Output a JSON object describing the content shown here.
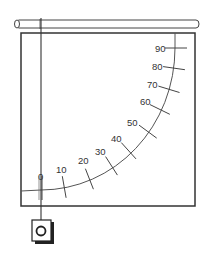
{
  "diagram": {
    "title": "",
    "type": "protractor-pendulum",
    "scale": {
      "unit": "degrees",
      "ticks": [
        {
          "value": "0",
          "x": 41,
          "y": 190,
          "lx": 38,
          "ly": 180,
          "ang": 90
        },
        {
          "value": "10",
          "x": 64,
          "y": 186,
          "lx": 56,
          "ly": 173,
          "ang": 84
        },
        {
          "value": "20",
          "x": 89,
          "y": 178,
          "lx": 78,
          "ly": 164,
          "ang": 72
        },
        {
          "value": "30",
          "x": 111,
          "y": 165,
          "lx": 95,
          "ly": 155,
          "ang": 60
        },
        {
          "value": "40",
          "x": 128,
          "y": 150,
          "lx": 111,
          "ly": 142,
          "ang": 50
        },
        {
          "value": "50",
          "x": 147,
          "y": 131,
          "lx": 127,
          "ly": 126,
          "ang": 40
        },
        {
          "value": "60",
          "x": 159,
          "y": 109,
          "lx": 140,
          "ly": 105,
          "ang": 30
        },
        {
          "value": "70",
          "x": 168,
          "y": 89,
          "lx": 147,
          "ly": 88,
          "ang": 20
        },
        {
          "value": "80",
          "x": 173,
          "y": 68,
          "lx": 152,
          "ly": 70,
          "ang": 5
        },
        {
          "value": "90",
          "x": 175,
          "y": 48,
          "lx": 155,
          "ly": 52,
          "ang": 0
        }
      ]
    },
    "parts": {
      "rod": "horizontal-rod",
      "board": "protractor-board",
      "string": "plumb-line",
      "weight": "hanging-weight"
    },
    "colors": {
      "line": "#333333",
      "stroke_light": "#555555",
      "background": "#ffffff"
    }
  }
}
